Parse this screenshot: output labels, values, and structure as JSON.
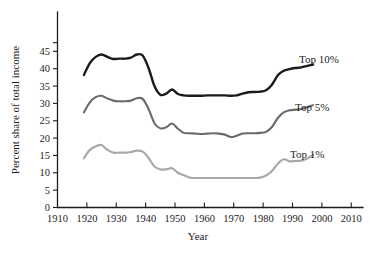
{
  "chart_data": {
    "type": "line",
    "title": "",
    "xlabel": "Year",
    "ylabel": "Percent share of total income",
    "xlim": [
      1910,
      2010
    ],
    "ylim": [
      0,
      47.5
    ],
    "grid": false,
    "legend_position": "inline-right",
    "xticks": [
      1910,
      1920,
      1930,
      1940,
      1950,
      1960,
      1970,
      1980,
      1990,
      2000,
      2010
    ],
    "xtick_labels": [
      "1910",
      "1920",
      "1930",
      "1940",
      "1950",
      "1960",
      "1970",
      "1980",
      "1990",
      "2000",
      "2010"
    ],
    "yticks": [
      0,
      5,
      10,
      15,
      20,
      25,
      30,
      35,
      40,
      45
    ],
    "ytick_labels": [
      "0",
      "5",
      "10",
      "15",
      "20",
      "25",
      "30",
      "35",
      "40",
      "45"
    ],
    "series": [
      {
        "name": "Top 10%",
        "color": "#1a1a1a",
        "label_text": "Top 10%",
        "x": [
          1919,
          1921,
          1923,
          1925,
          1927,
          1929,
          1931,
          1933,
          1935,
          1937,
          1939,
          1941,
          1943,
          1945,
          1947,
          1949,
          1951,
          1953,
          1955,
          1957,
          1959,
          1961,
          1963,
          1965,
          1967,
          1969,
          1971,
          1973,
          1975,
          1977,
          1979,
          1981,
          1983,
          1985,
          1987,
          1989,
          1991,
          1993,
          1995,
          1997
        ],
        "values": [
          38.2,
          41.6,
          43.4,
          44.1,
          43.4,
          42.8,
          42.9,
          42.9,
          43.2,
          44.1,
          43.8,
          40.2,
          35.0,
          32.5,
          32.8,
          34.0,
          32.7,
          32.3,
          32.2,
          32.2,
          32.2,
          32.3,
          32.3,
          32.3,
          32.3,
          32.2,
          32.3,
          32.8,
          33.2,
          33.3,
          33.4,
          33.8,
          35.4,
          38.1,
          39.4,
          39.9,
          40.2,
          40.4,
          40.8,
          41.2
        ]
      },
      {
        "name": "Top 5%",
        "color": "#6b6b6b",
        "label_text": "Top 5%",
        "x": [
          1919,
          1921,
          1923,
          1925,
          1927,
          1929,
          1931,
          1933,
          1935,
          1937,
          1939,
          1941,
          1943,
          1945,
          1947,
          1949,
          1951,
          1953,
          1955,
          1957,
          1959,
          1961,
          1963,
          1965,
          1967,
          1969,
          1971,
          1973,
          1975,
          1977,
          1979,
          1981,
          1983,
          1985,
          1987,
          1989,
          1991,
          1993,
          1995,
          1997
        ],
        "values": [
          27.4,
          30.3,
          31.8,
          32.2,
          31.4,
          30.8,
          30.6,
          30.6,
          30.8,
          31.5,
          31.3,
          28.4,
          24.3,
          22.8,
          23.1,
          24.2,
          22.7,
          21.5,
          21.4,
          21.3,
          21.2,
          21.3,
          21.4,
          21.3,
          21.0,
          20.3,
          20.7,
          21.3,
          21.4,
          21.4,
          21.5,
          21.8,
          23.2,
          25.8,
          27.4,
          28.0,
          28.2,
          28.4,
          28.9,
          29.5
        ]
      },
      {
        "name": "Top 1%",
        "color": "#a8a8a8",
        "label_text": "Top 1%",
        "x": [
          1919,
          1921,
          1923,
          1925,
          1927,
          1929,
          1931,
          1933,
          1935,
          1937,
          1939,
          1941,
          1943,
          1945,
          1947,
          1949,
          1951,
          1953,
          1955,
          1957,
          1959,
          1961,
          1963,
          1965,
          1967,
          1969,
          1971,
          1973,
          1975,
          1977,
          1979,
          1981,
          1983,
          1985,
          1987,
          1989,
          1991,
          1993,
          1995,
          1997
        ],
        "values": [
          14.2,
          16.6,
          17.6,
          18.0,
          16.6,
          15.8,
          15.8,
          15.8,
          16.0,
          16.4,
          16.1,
          14.3,
          11.8,
          11.0,
          11.0,
          11.3,
          10.0,
          9.3,
          8.6,
          8.5,
          8.5,
          8.5,
          8.5,
          8.5,
          8.5,
          8.5,
          8.5,
          8.5,
          8.5,
          8.5,
          8.6,
          9.2,
          10.5,
          12.6,
          13.9,
          13.3,
          13.4,
          13.5,
          14.1,
          15.2
        ]
      }
    ]
  },
  "axes": {
    "y_title": "Percent share of total income",
    "x_title": "Year"
  }
}
